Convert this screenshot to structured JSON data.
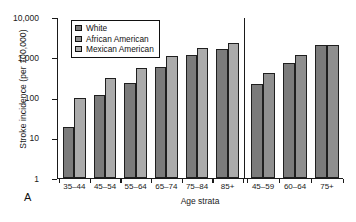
{
  "panel_letter": "A",
  "axes": {
    "ylabel": "Stroke incidence (per 100,000)",
    "xlabel": "Age strata",
    "yticks": [
      "10,000",
      "1,000",
      "100",
      "10",
      "1"
    ]
  },
  "legend": {
    "items": [
      {
        "label": "White",
        "color": "#7b7b7b"
      },
      {
        "label": "African American",
        "color": "#8f8f8f"
      },
      {
        "label": "Mexican American",
        "color": "#ababab"
      }
    ]
  },
  "colors": {
    "white_series": "#7b7b7b",
    "african_american_series": "#8f8f8f",
    "mexican_american_series": "#ababab",
    "axis": "#1a1a1a",
    "background": "#ffffff"
  },
  "chart_data": {
    "type": "bar",
    "title": "",
    "xlabel": "Age strata",
    "ylabel": "Stroke incidence (per 100,000)",
    "yscale": "log",
    "ylim": [
      1,
      10000
    ],
    "grid": false,
    "legend_position": "top-left",
    "panels": [
      {
        "name": "left",
        "categories": [
          "35–44",
          "45–54",
          "55–64",
          "65–74",
          "75–84",
          "85+"
        ],
        "series": [
          {
            "name": "White",
            "values": [
              18,
              115,
              230,
              560,
              1100,
              1600
            ]
          },
          {
            "name": "Mexican American",
            "values": [
              95,
              300,
              520,
              1030,
              1700,
              2150
            ]
          }
        ]
      },
      {
        "name": "right",
        "categories": [
          "45–59",
          "60–64",
          "75+"
        ],
        "series": [
          {
            "name": "White",
            "values": [
              210,
              700,
              1950
            ]
          },
          {
            "name": "African American",
            "values": [
              400,
              1120,
              1950
            ]
          }
        ]
      }
    ]
  }
}
